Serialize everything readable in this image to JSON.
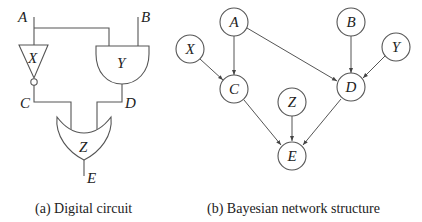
{
  "figure": {
    "panel_a": {
      "caption": "(a) Digital circuit",
      "inputs": [
        "A",
        "B"
      ],
      "gates": [
        {
          "name": "X",
          "type": "NOT",
          "input": "A",
          "output": "C"
        },
        {
          "name": "Y",
          "type": "AND",
          "inputs": [
            "A",
            "B"
          ],
          "output": "D"
        },
        {
          "name": "Z",
          "type": "OR",
          "inputs": [
            "C",
            "D"
          ],
          "output": "E"
        }
      ],
      "labels": {
        "A": "A",
        "B": "B",
        "C": "C",
        "D": "D",
        "E": "E",
        "X": "X",
        "Y": "Y",
        "Z": "Z"
      }
    },
    "panel_b": {
      "caption": "(b) Bayesian network structure",
      "nodes": [
        {
          "id": "A",
          "label": "A"
        },
        {
          "id": "B",
          "label": "B"
        },
        {
          "id": "X",
          "label": "X"
        },
        {
          "id": "Y",
          "label": "Y"
        },
        {
          "id": "C",
          "label": "C"
        },
        {
          "id": "D",
          "label": "D"
        },
        {
          "id": "Z",
          "label": "Z"
        },
        {
          "id": "E",
          "label": "E"
        }
      ],
      "edges": [
        [
          "A",
          "C"
        ],
        [
          "X",
          "C"
        ],
        [
          "A",
          "D"
        ],
        [
          "B",
          "D"
        ],
        [
          "Y",
          "D"
        ],
        [
          "C",
          "E"
        ],
        [
          "Z",
          "E"
        ],
        [
          "D",
          "E"
        ]
      ]
    }
  }
}
